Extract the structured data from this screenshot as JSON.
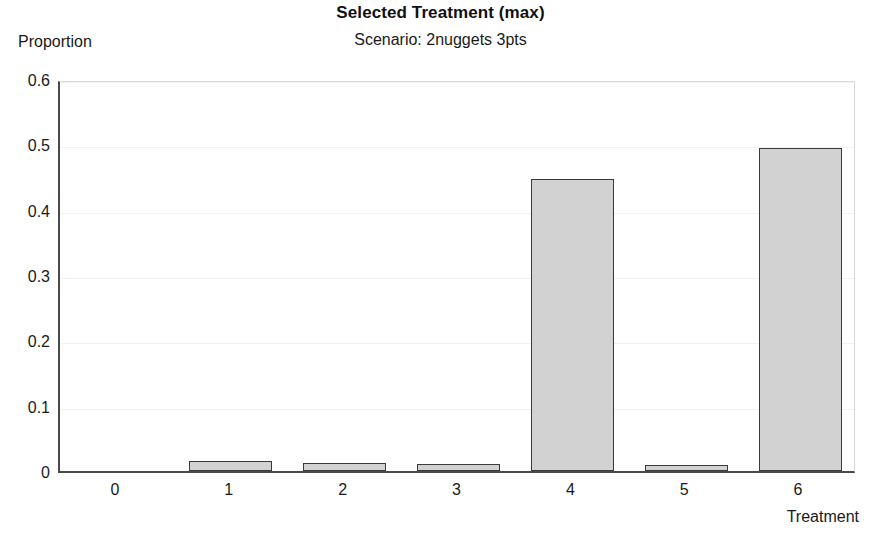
{
  "chart_data": {
    "type": "bar",
    "title": "Selected Treatment (max)",
    "subtitle": "Scenario: 2nuggets 3pts",
    "xlabel": "Treatment",
    "ylabel": "Proportion",
    "categories": [
      "0",
      "1",
      "2",
      "3",
      "4",
      "5",
      "6"
    ],
    "values": [
      0,
      0.015,
      0.012,
      0.01,
      0.447,
      0.009,
      0.494
    ],
    "series": [
      {
        "name": "Proportion",
        "values": [
          0,
          0.015,
          0.012,
          0.01,
          0.447,
          0.009,
          0.494
        ]
      }
    ],
    "ylim": [
      0,
      0.6
    ],
    "ytick_labels": [
      "0",
      "0.1",
      "0.2",
      "0.3",
      "0.4",
      "0.5",
      "0.6"
    ],
    "ytick_values": [
      0,
      0.1,
      0.2,
      0.3,
      0.4,
      0.5,
      0.6
    ],
    "xtick_labels": [
      "0",
      "1",
      "2",
      "3",
      "4",
      "5",
      "6"
    ],
    "grid": true,
    "legend": null,
    "bar_fill_color": "#d2d2d2",
    "bar_edge_color": "#3a3a3a",
    "axis_color": "#4a4a4a",
    "grid_color": "#f2f2f2",
    "background_color": "#ffffff"
  }
}
